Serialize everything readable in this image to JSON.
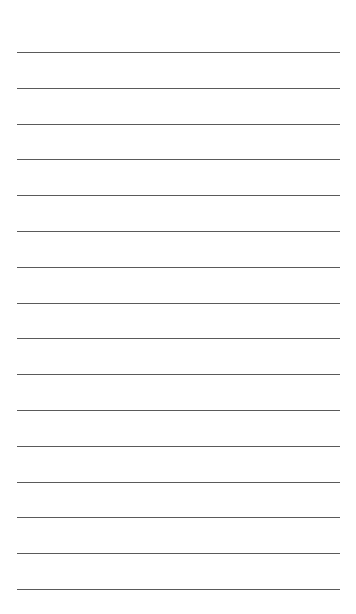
{
  "page": {
    "type": "lined-paper",
    "background": "#ffffff",
    "line_color": "#5a5a5a",
    "line_count": 16,
    "first_line_y": 52,
    "line_spacing": 35.8,
    "line_left": 17,
    "line_right": 340
  }
}
